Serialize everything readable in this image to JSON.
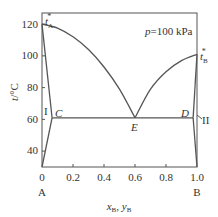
{
  "chart_data": {
    "type": "phase-diagram",
    "title": "",
    "annotation_pressure": "p=100 kPa",
    "xlabel": "x_B, y_B",
    "ylabel": "t/°C",
    "xlim": [
      0,
      1.0
    ],
    "ylim": [
      30,
      127
    ],
    "x_ticks": [
      0,
      0.2,
      0.4,
      0.6,
      0.8,
      1.0
    ],
    "x_tick_labels": [
      "0",
      "0.2",
      "0.4",
      "0.6",
      "0.8",
      "1.0"
    ],
    "y_ticks": [
      40,
      60,
      80,
      100,
      120
    ],
    "y_tick_labels": [
      "40",
      "60",
      "80",
      "100",
      "120"
    ],
    "endpoint_labels": {
      "left": "A",
      "right": "B"
    },
    "points": {
      "tA_star": {
        "x": 0.0,
        "t": 120,
        "label": "t*A"
      },
      "tB_star": {
        "x": 1.0,
        "t": 101,
        "label": "t*B"
      },
      "C": {
        "x": 0.065,
        "t": 61,
        "label": "C"
      },
      "D": {
        "x": 0.975,
        "t": 61,
        "label": "D"
      },
      "E": {
        "x": 0.6,
        "t": 61,
        "label": "E"
      }
    },
    "region_labels": [
      {
        "label": "I",
        "x": 0.03,
        "t": 66
      },
      {
        "label": "II",
        "x": 1.06,
        "t": 60
      }
    ],
    "series": [
      {
        "name": "liquidus-A",
        "points": [
          [
            0,
            120
          ],
          [
            0.1,
            117.5
          ],
          [
            0.2,
            112
          ],
          [
            0.3,
            104
          ],
          [
            0.4,
            93
          ],
          [
            0.5,
            79
          ],
          [
            0.6,
            61
          ]
        ]
      },
      {
        "name": "liquidus-B",
        "points": [
          [
            0.6,
            61
          ],
          [
            0.7,
            79
          ],
          [
            0.8,
            90
          ],
          [
            0.9,
            97
          ],
          [
            1.0,
            101
          ]
        ]
      },
      {
        "name": "solidus-A",
        "points": [
          [
            0,
            120
          ],
          [
            0.065,
            61
          ]
        ]
      },
      {
        "name": "solvus-A",
        "points": [
          [
            0.065,
            61
          ],
          [
            0.0,
            30
          ]
        ]
      },
      {
        "name": "solidus-B",
        "points": [
          [
            1.0,
            101
          ],
          [
            0.975,
            61
          ]
        ]
      },
      {
        "name": "solvus-B",
        "points": [
          [
            0.975,
            61
          ],
          [
            1.0,
            30
          ]
        ]
      },
      {
        "name": "eutectic-line",
        "points": [
          [
            0.065,
            61
          ],
          [
            0.975,
            61
          ]
        ]
      }
    ]
  }
}
